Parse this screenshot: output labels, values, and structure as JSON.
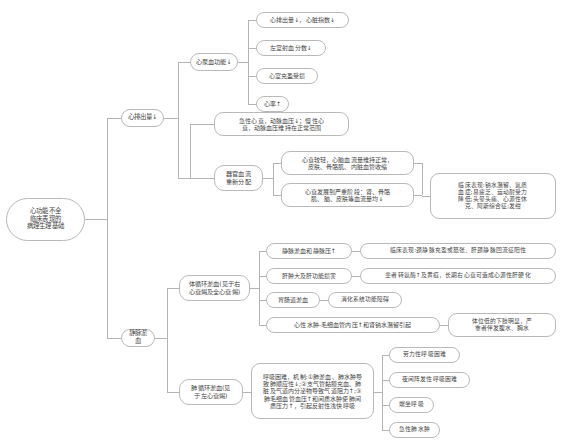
{
  "diagram": {
    "type": "mind-map",
    "orientation": "left-to-right",
    "line_color": "#b4b4b4",
    "node_border_color": "#b9b9b9",
    "node_fill_color": "#ffffff",
    "text_color": "#3f3f3f"
  },
  "root": {
    "label": "心功能不全\n临床表现的\n病理生理基础",
    "line1": "心功能不全",
    "line2": "临床表现的",
    "line3": "病理生理基础"
  },
  "branches": {
    "cardiac_output": {
      "label": "心排出量↓",
      "children": {
        "pump_function": {
          "label": "心泵血功能↓",
          "items": [
            {
              "label": "心排出量↓，心脏指数↓"
            },
            {
              "label": "左室射血分数↓"
            },
            {
              "label": "心室充盈受损"
            },
            {
              "label": "心率↑"
            }
          ]
        },
        "blood_redistribution": {
          "note": "急性心衰，动脉血压↓；慢性心\n衰，动脉血压维持在正常范围",
          "note_line1": "急性心衰，动脉血压↓；慢性心",
          "note_line2": "衰，动脉血压维持在正常范围",
          "label": "器官血流\n重新分配",
          "label_line1": "器官血流",
          "label_line2": "重新分配",
          "items": [
            {
              "line1": "心衰较轻，心脑血流量维持正常，",
              "line2": "皮肤、骨骼肌、内脏血管收缩"
            },
            {
              "line1": "心衰发展到严重阶段：肾、骨骼",
              "line2": "肌、脑、皮肤等血流量均↓"
            }
          ],
          "clinical": {
            "line1": "临床表现:钠水潴留、氮质",
            "line2": "血症;易疲乏、运动耐受力",
            "line3": "降低;头晕头痛、心源性休",
            "line4": "克、阿斯综合征;发绀"
          }
        }
      }
    },
    "venous_congestion": {
      "label": "静脉淤血",
      "children": {
        "systemic": {
          "label": "体循环淤血(见于右\n心衰竭及全心衰竭)",
          "label_line1": "体循环淤血(见于右",
          "label_line2": "心衰竭及全心衰竭)",
          "items": [
            {
              "label": "静脉淤血和静脉压↑",
              "detail": "临床表现:颈静脉充盈或怒张、肝颈静脉回流征阳性"
            },
            {
              "label": "肝肿大及肝功能损害",
              "detail": "患者转氨酶↑及黄疸，长期右心衰可造成心源性肝硬化"
            },
            {
              "label": "胃肠道淤血",
              "detail": "消化系统功能障碍"
            },
            {
              "label": "心性水肿-毛细血管内压↑和肾钠水潴留引起",
              "detail_line1": "体位低的下肢明显，严",
              "detail_line2": "重者伴发腹水、胸水"
            }
          ]
        },
        "pulmonary": {
          "label": "肺循环淤血(见\n于左心衰竭)",
          "label_line1": "肺循环淤血(见",
          "label_line2": "于左心衰竭)",
          "mechanism": {
            "line1": "呼吸困难，机制:①肺淤血、肺水肿导",
            "line2": "致肺顺应性↓;②支气管黏膜充血、肺",
            "line3": "脏及气道内分泌物导致气道阻力↑;③",
            "line4": "肺毛细血管血压↑和间质水肿使肺间",
            "line5": "质压力↑，引起反射性浅快呼吸"
          },
          "items": [
            {
              "label": "劳力性呼吸困难"
            },
            {
              "label": "夜间阵发性呼吸困难"
            },
            {
              "label": "端坐呼吸"
            },
            {
              "label": "急性肺水肿"
            }
          ]
        }
      }
    }
  }
}
